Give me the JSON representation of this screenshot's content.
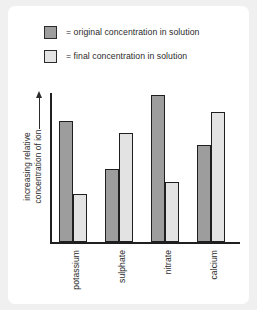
{
  "chart_data": {
    "type": "bar",
    "title": "",
    "xlabel": "",
    "ylabel": "increasing relative concentration of ion",
    "categories": [
      "potassium",
      "sulphate",
      "nitrate",
      "calcium"
    ],
    "series": [
      {
        "name": "= original concentration in solution",
        "color": "#9d9d9d",
        "values": [
          81,
          49,
          99,
          65
        ]
      },
      {
        "name": "= final concentration in solution",
        "color": "#e3e3e3",
        "values": [
          32,
          73,
          40,
          87
        ]
      }
    ],
    "ylim": [
      0,
      100
    ],
    "grid": false,
    "legend_position": "top",
    "axis_arrow": "up"
  },
  "legend": {
    "items": [
      {
        "label": "= original concentration in solution",
        "swatch": "original"
      },
      {
        "label": "= final concentration in solution",
        "swatch": "final"
      }
    ]
  },
  "colors": {
    "original": "#9d9d9d",
    "final": "#e3e3e3",
    "axis": "#1f1f1f",
    "text": "#2b2b2b",
    "card": "#ffffff",
    "background": "#f0f0f0"
  }
}
